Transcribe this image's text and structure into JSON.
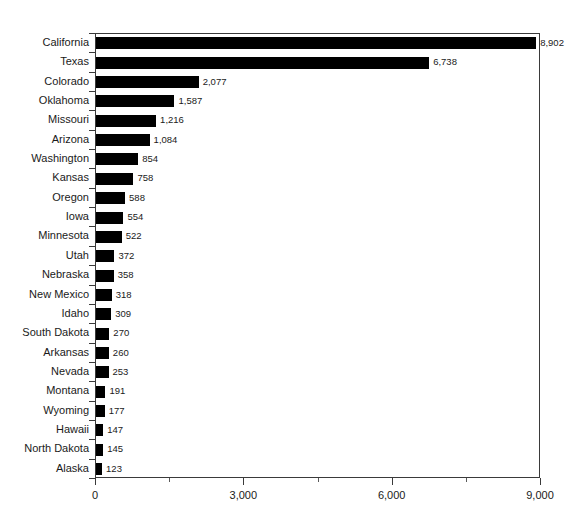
{
  "chart_data": {
    "type": "bar",
    "orientation": "horizontal",
    "title": "",
    "xlabel": "",
    "ylabel": "",
    "xlim": [
      0,
      9000
    ],
    "grid": false,
    "legend": null,
    "bar_color": "#000000",
    "background_color": "#ffffff",
    "axis_color": "#3a3a3a",
    "xticks": [
      0,
      3000,
      6000,
      9000
    ],
    "xtick_labels": [
      "0",
      "3,000",
      "6,000",
      "9,000"
    ],
    "xminor_ticks": [
      1500,
      4500,
      7500
    ],
    "categories": [
      "California",
      "Texas",
      "Colorado",
      "Oklahoma",
      "Missouri",
      "Arizona",
      "Washington",
      "Kansas",
      "Oregon",
      "Iowa",
      "Minnesota",
      "Utah",
      "Nebraska",
      "New Mexico",
      "Idaho",
      "South Dakota",
      "Arkansas",
      "Nevada",
      "Montana",
      "Wyoming",
      "Hawaii",
      "North Dakota",
      "Alaska"
    ],
    "values": [
      8902,
      6738,
      2077,
      1587,
      1216,
      1084,
      854,
      758,
      588,
      554,
      522,
      372,
      358,
      318,
      309,
      270,
      260,
      253,
      191,
      177,
      147,
      145,
      123
    ],
    "value_labels": [
      "8,902",
      "6,738",
      "2,077",
      "1,587",
      "1,216",
      "1,084",
      "854",
      "758",
      "588",
      "554",
      "522",
      "372",
      "358",
      "318",
      "309",
      "270",
      "260",
      "253",
      "191",
      "177",
      "147",
      "145",
      "123"
    ]
  }
}
